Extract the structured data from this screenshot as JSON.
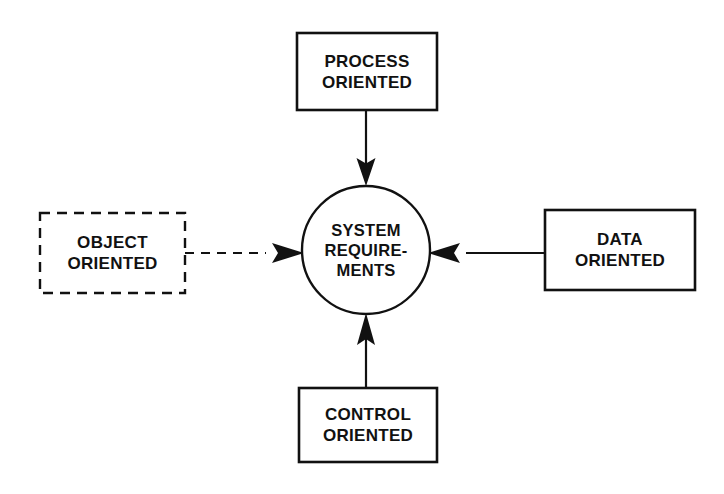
{
  "diagram": {
    "center": {
      "name": "system-requirements",
      "shape": "circle",
      "lines": [
        "SYSTEM",
        "REQUIRE-",
        "MENTS"
      ],
      "cx": 366,
      "cy": 250,
      "r": 64,
      "stroke": "#111111",
      "fill": "#ffffff"
    },
    "nodes": [
      {
        "id": "process-oriented",
        "lines": [
          "PROCESS",
          "ORIENTED"
        ],
        "shape": "rect",
        "border": "solid",
        "x": 297,
        "y": 33,
        "width": 140,
        "height": 77,
        "stroke": "#111111",
        "fill": "#ffffff"
      },
      {
        "id": "object-oriented",
        "lines": [
          "OBJECT",
          "ORIENTED"
        ],
        "shape": "rect",
        "border": "dashed",
        "x": 40,
        "y": 213,
        "width": 145,
        "height": 80,
        "stroke": "#111111",
        "fill": "#ffffff"
      },
      {
        "id": "data-oriented",
        "lines": [
          "DATA",
          "ORIENTED"
        ],
        "shape": "rect",
        "border": "solid",
        "x": 545,
        "y": 210,
        "width": 150,
        "height": 80,
        "stroke": "#111111",
        "fill": "#ffffff"
      },
      {
        "id": "control-oriented",
        "lines": [
          "CONTROL",
          "ORIENTED"
        ],
        "shape": "rect",
        "border": "solid",
        "x": 299,
        "y": 388,
        "width": 138,
        "height": 74,
        "stroke": "#111111",
        "fill": "#ffffff"
      }
    ],
    "connectors": [
      {
        "id": "process-to-center",
        "from": "process-oriented",
        "to": "system-requirements",
        "style": "solid",
        "direction": "down",
        "arrowhead": "filled-triangle"
      },
      {
        "id": "object-to-center",
        "from": "object-oriented",
        "to": "system-requirements",
        "style": "dashed",
        "direction": "right",
        "arrowhead": "filled-triangle"
      },
      {
        "id": "data-to-center",
        "from": "data-oriented",
        "to": "system-requirements",
        "style": "solid",
        "direction": "left",
        "arrowhead": "filled-triangle"
      },
      {
        "id": "control-to-center",
        "from": "control-oriented",
        "to": "system-requirements",
        "style": "solid",
        "direction": "up",
        "arrowhead": "filled-triangle"
      }
    ]
  }
}
